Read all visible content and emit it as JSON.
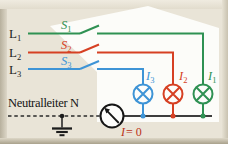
{
  "figure": {
    "type": "three-phase-circuit-diagram",
    "background_color": "#e9e4d7",
    "highlight_color": "#fcfcf9"
  },
  "colors": {
    "phase_l1": "#2f9153",
    "phase_l2": "#d64023",
    "phase_l3": "#3e94d6",
    "neutral_line": "#2a2a2a",
    "bottom_rail": "#3d3d3d",
    "meter": "#151515",
    "reading_text": "#bb3317",
    "label_text": "#1d1d1d"
  },
  "labels": {
    "phases": [
      {
        "base": "L",
        "sub": "1"
      },
      {
        "base": "L",
        "sub": "2"
      },
      {
        "base": "L",
        "sub": "3"
      }
    ],
    "switches": [
      {
        "base": "S",
        "sub": "1"
      },
      {
        "base": "S",
        "sub": "2"
      },
      {
        "base": "S",
        "sub": "3"
      }
    ],
    "lamp_currents": [
      {
        "base": "I",
        "sub": "3"
      },
      {
        "base": "I",
        "sub": "2"
      },
      {
        "base": "I",
        "sub": "1"
      }
    ],
    "neutral": "Neutralleiter N",
    "ammeter_reading": {
      "var": "I",
      "eq": "= 0"
    }
  },
  "icons": {
    "lamp": "circle-cross-lamp-symbol",
    "ammeter": "circle-needle-meter-symbol",
    "ground": "earth-ground-symbol",
    "junction": "filled-dot"
  }
}
